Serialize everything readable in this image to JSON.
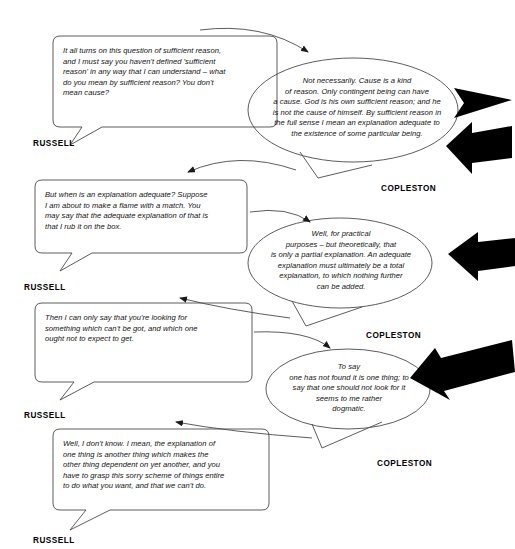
{
  "diagram": {
    "stroke_color": "#3a3a3a",
    "arrow_color": "#000000",
    "background": "#ffffff",
    "speakers": {
      "russell": "RUSSELL",
      "copleston": "COPLESTON"
    },
    "exchanges": [
      {
        "id": "russell-1",
        "speaker": "RUSSELL",
        "shape": "rounded-rectangle",
        "text": "It all turns on this question of sufficient reason,\nand I must say you haven't defined 'sufficient\nreason' in any way that I can understand – what\ndo you mean by sufficient reason? You don't\nmean cause?"
      },
      {
        "id": "copleston-1",
        "speaker": "COPLESTON",
        "shape": "ellipse",
        "text": "Not necessarily. Cause is a kind\nof reason. Only contingent being can have\na cause. God is his own sufficient reason; and he\nis not the cause of himself. By sufficient reason in\nthe full sense I mean an explanation adequate to\nthe existence of some particular being."
      },
      {
        "id": "russell-2",
        "speaker": "RUSSELL",
        "shape": "rounded-rectangle",
        "text": "But when is an explanation adequate? Suppose\nI am about to make a flame with a match. You\nmay say that the adequate explanation of that is\nthat I rub it on the box."
      },
      {
        "id": "copleston-2",
        "speaker": "COPLESTON",
        "shape": "ellipse",
        "text": "Well, for practical\npurposes – but theoretically, that\nis only a partial explanation. An adequate\nexplanation must ultimately be a total\nexplanation, to which nothing further\ncan be added."
      },
      {
        "id": "russell-3",
        "speaker": "RUSSELL",
        "shape": "rounded-rectangle",
        "text": "Then I can only say that you're looking for\nsomething which can't be got, and which one\nought not to expect to get."
      },
      {
        "id": "copleston-3",
        "speaker": "COPLESTON",
        "shape": "ellipse",
        "text": "To say\none has not found it is one thing; to\nsay that one should not look for it\nseems to me rather\ndogmatic."
      },
      {
        "id": "russell-4",
        "speaker": "RUSSELL",
        "shape": "rounded-rectangle",
        "text": "Well, I don't know. I mean, the explanation of\none thing is another thing which makes the\nother thing dependent on yet another, and you\nhave to grasp this sorry scheme of things entire\nto do what you want, and that we can't do."
      }
    ],
    "speaker_labels": [
      {
        "id": "label-russell-1",
        "text": "RUSSELL"
      },
      {
        "id": "label-copleston-1",
        "text": "COPLESTON"
      },
      {
        "id": "label-russell-2",
        "text": "RUSSELL"
      },
      {
        "id": "label-copleston-2",
        "text": "COPLESTON"
      },
      {
        "id": "label-russell-3",
        "text": "RUSSELL"
      },
      {
        "id": "label-copleston-3",
        "text": "COPLESTON"
      },
      {
        "id": "label-russell-4",
        "text": "RUSSELL"
      }
    ],
    "annotation_arrows": [
      {
        "id": "arrow-plain-1",
        "style": "solid-triangle",
        "points_to": "copleston-1"
      },
      {
        "id": "arrow-block-1",
        "style": "block-arrow",
        "points_to": "copleston-1"
      },
      {
        "id": "arrow-block-2",
        "style": "block-arrow",
        "points_to": "copleston-2"
      },
      {
        "id": "arrow-block-3",
        "style": "block-arrow-diagonal",
        "points_to": "copleston-3"
      }
    ]
  }
}
